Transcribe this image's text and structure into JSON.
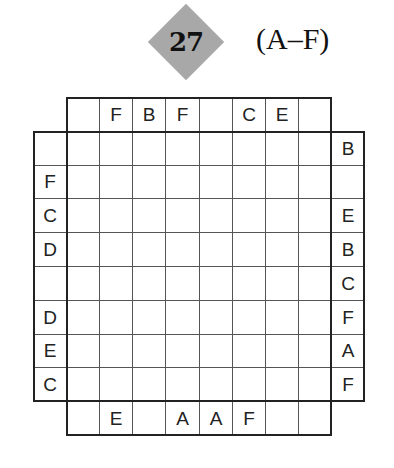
{
  "puzzle": {
    "number": "27",
    "letter_range": "(A–F)",
    "grid_size": 8,
    "clues": {
      "top": [
        "",
        "F",
        "B",
        "F",
        "",
        "C",
        "E",
        ""
      ],
      "bottom": [
        "",
        "E",
        "",
        "A",
        "A",
        "F",
        "",
        ""
      ],
      "left": [
        "",
        "F",
        "C",
        "D",
        "",
        "D",
        "E",
        "C"
      ],
      "right": [
        "B",
        "",
        "E",
        "B",
        "C",
        "F",
        "A",
        "F"
      ]
    },
    "cells": [
      [
        "",
        "",
        "",
        "",
        "",
        "",
        "",
        ""
      ],
      [
        "",
        "",
        "",
        "",
        "",
        "",
        "",
        ""
      ],
      [
        "",
        "",
        "",
        "",
        "",
        "",
        "",
        ""
      ],
      [
        "",
        "",
        "",
        "",
        "",
        "",
        "",
        ""
      ],
      [
        "",
        "",
        "",
        "",
        "",
        "",
        "",
        ""
      ],
      [
        "",
        "",
        "",
        "",
        "",
        "",
        "",
        ""
      ],
      [
        "",
        "",
        "",
        "",
        "",
        "",
        "",
        ""
      ],
      [
        "",
        "",
        "",
        "",
        "",
        "",
        "",
        ""
      ]
    ]
  }
}
